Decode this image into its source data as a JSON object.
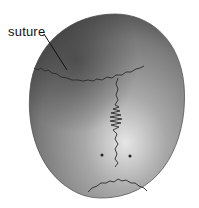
{
  "figure": {
    "annotation": {
      "label": "suture"
    },
    "colors": {
      "bone_dark": "#4a4a4a",
      "bone_mid": "#8c8c8c",
      "bone_light": "#d8d8d8",
      "suture_line": "#2a2a2a",
      "background": "#ffffff"
    }
  }
}
